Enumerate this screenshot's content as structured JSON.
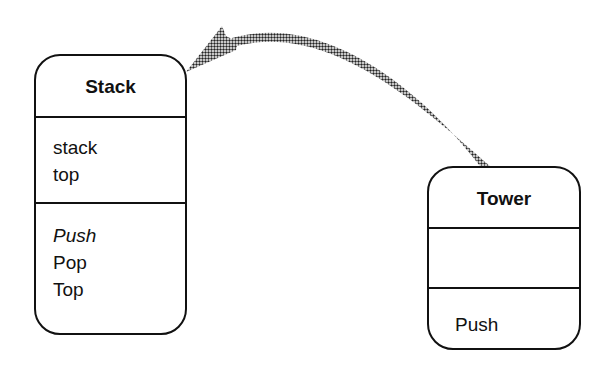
{
  "diagram": {
    "type": "class-diagram",
    "classes": [
      {
        "name": "Stack",
        "attributes": [
          "stack",
          "top"
        ],
        "operations": [
          {
            "label": "Push",
            "italic": true
          },
          {
            "label": "Pop",
            "italic": false
          },
          {
            "label": "Top",
            "italic": false
          }
        ]
      },
      {
        "name": "Tower",
        "attributes": [],
        "operations": [
          {
            "label": "Push",
            "italic": false
          }
        ]
      }
    ],
    "relationships": [
      {
        "from": "Tower",
        "to": "Stack",
        "style": "curved-halftone-arrow"
      }
    ],
    "colors": {
      "stroke": "#111111",
      "arrow_fill": "#555555",
      "background": "#ffffff"
    }
  }
}
